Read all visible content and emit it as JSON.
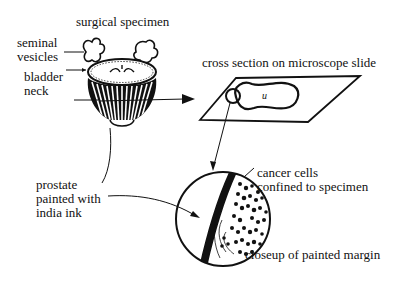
{
  "diagram": {
    "labels": {
      "surgical_specimen": "surgical specimen",
      "seminal_vesicles_1": "seminal",
      "seminal_vesicles_2": "vesicles",
      "bladder_neck_1": "bladder",
      "bladder_neck_2": "neck",
      "cross_section": "cross section on microscope slide",
      "slide_mark": "и",
      "prostate_1": "prostate",
      "prostate_2": "painted with",
      "prostate_3": "india ink",
      "cancer_1": "cancer cells",
      "cancer_2": "confined to specimen",
      "closeup": "closeup of painted margin"
    },
    "colors": {
      "ink": "#111111",
      "background": "#ffffff"
    }
  }
}
